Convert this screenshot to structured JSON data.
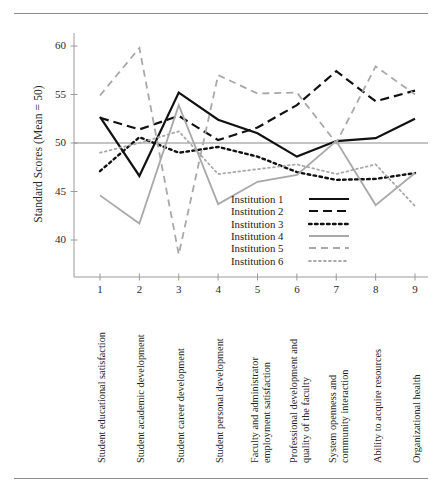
{
  "figure": {
    "has_top_rule": true,
    "has_bottom_rule": true
  },
  "axes": {
    "ylabel": "Standard Scores (Mean = 50)",
    "yticks": [
      "60",
      "55",
      "50",
      "45",
      "40"
    ],
    "xticks": [
      "1",
      "2",
      "3",
      "4",
      "5",
      "6",
      "7",
      "8",
      "9"
    ]
  },
  "categories_display": [
    {
      "line1": "Student educational satisfaction",
      "line2": ""
    },
    {
      "line1": "Student academic development",
      "line2": ""
    },
    {
      "line1": "Student career development",
      "line2": ""
    },
    {
      "line1": "Student personal development",
      "line2": ""
    },
    {
      "line1": "Faculty and administrator",
      "line2": "employment satisfaction"
    },
    {
      "line1": "Professional development and",
      "line2": "quality of the faculty"
    },
    {
      "line1": "System openness and",
      "line2": "community interaction"
    },
    {
      "line1": "Ability to acquire resources",
      "line2": ""
    },
    {
      "line1": "Organizational health",
      "line2": ""
    }
  ],
  "legend": {
    "entries": [
      {
        "label": "Institution 1",
        "style": "solid-black"
      },
      {
        "label": "Institution 2",
        "style": "dashed-black"
      },
      {
        "label": "Institution 3",
        "style": "dotted-black"
      },
      {
        "label": "Institution 4",
        "style": "solid-gray"
      },
      {
        "label": "Institution 5",
        "style": "dashed-gray"
      },
      {
        "label": "Institution 6",
        "style": "dotted-gray"
      }
    ]
  },
  "colors": {
    "black": "#111111",
    "gray": "#a8a8a8",
    "axis": "#9a9a9a",
    "reference_line": "#8a8a8a",
    "rule": "#8d8d8d"
  },
  "chart_data": {
    "type": "line",
    "title": "",
    "xlabel": "",
    "ylabel": "Standard Scores (Mean = 50)",
    "ylim": [
      36,
      62
    ],
    "xlim": [
      0.6,
      9.4
    ],
    "grid": false,
    "reference_line": 50,
    "legend_position": "inside-center-right",
    "x": [
      1,
      2,
      3,
      4,
      5,
      6,
      7,
      8,
      9
    ],
    "categories": [
      "Student educational satisfaction",
      "Student academic development",
      "Student career development",
      "Student personal development",
      "Faculty and administrator employment satisfaction",
      "Professional development and quality of the faculty",
      "System openness and community interaction",
      "Ability to acquire resources",
      "Organizational health"
    ],
    "series": [
      {
        "name": "Institution 1",
        "style": "solid",
        "color": "#111111",
        "width": 2.2,
        "values": [
          52.7,
          46.6,
          55.2,
          52.4,
          51.0,
          48.6,
          50.2,
          50.5,
          52.5
        ]
      },
      {
        "name": "Institution 2",
        "style": "dashed",
        "color": "#111111",
        "width": 2.2,
        "values": [
          52.6,
          51.4,
          52.8,
          50.3,
          51.6,
          53.9,
          57.4,
          54.3,
          55.4
        ]
      },
      {
        "name": "Institution 3",
        "style": "dotted",
        "color": "#111111",
        "width": 2.4,
        "values": [
          47.1,
          50.6,
          49.0,
          49.6,
          48.6,
          47.0,
          46.2,
          46.3,
          46.9
        ]
      },
      {
        "name": "Institution 4",
        "style": "solid",
        "color": "#a8a8a8",
        "width": 1.8,
        "values": [
          44.6,
          41.7,
          53.9,
          43.7,
          46.0,
          46.7,
          50.2,
          43.6,
          46.9
        ]
      },
      {
        "name": "Institution 5",
        "style": "dashed",
        "color": "#a8a8a8",
        "width": 1.8,
        "values": [
          54.9,
          59.8,
          38.5,
          57.0,
          55.1,
          55.2,
          50.0,
          57.9,
          55.0
        ]
      },
      {
        "name": "Institution 6",
        "style": "dotted",
        "color": "#a8a8a8",
        "width": 1.8,
        "values": [
          49.0,
          50.0,
          51.2,
          46.8,
          47.3,
          47.8,
          46.8,
          47.8,
          43.5
        ]
      }
    ]
  }
}
